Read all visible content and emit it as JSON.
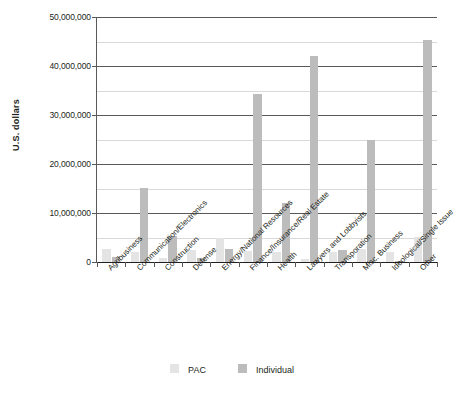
{
  "chart_data": {
    "type": "bar",
    "title": "",
    "xlabel": "",
    "ylabel": "U.S. dollars",
    "ylim": [
      0,
      50000000
    ],
    "ytick_values": [
      0,
      10000000,
      20000000,
      30000000,
      40000000,
      50000000
    ],
    "ytick_labels": [
      "0",
      "10,000,000",
      "20,000,000",
      "30,000,000",
      "40,000,000",
      "50,000,000"
    ],
    "minor_gridlines": [
      5000000,
      15000000,
      25000000,
      35000000,
      45000000
    ],
    "grid": true,
    "legend_position": "bottom",
    "categories": [
      "Agribusiness",
      "Communication/Electronics",
      "Construction",
      "Defense",
      "Energy/National Resources",
      "Finance/Insurance/Real Estate",
      "Health",
      "Lawyers and Lobbyists",
      "Transporation",
      "Misc. Business",
      "Ideological/Single Issue",
      "Other"
    ],
    "series": [
      {
        "name": "PAC",
        "color": "#e4e4e4",
        "values": [
          2600000,
          2100000,
          900000,
          2500000,
          4900000,
          2200000,
          2100000,
          600000,
          2000000,
          2600000,
          2100000,
          5200000
        ]
      },
      {
        "name": "Individual",
        "color": "#bcbcbc",
        "values": [
          1100000,
          15100000,
          5300000,
          900000,
          2600000,
          34300000,
          12100000,
          42000000,
          2400000,
          24800000,
          200000,
          45400000
        ]
      }
    ]
  },
  "legend": {
    "entries": [
      {
        "label": "PAC",
        "color": "#e4e4e4"
      },
      {
        "label": "Individual",
        "color": "#bcbcbc"
      }
    ]
  }
}
